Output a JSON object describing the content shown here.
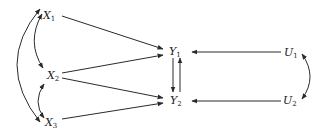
{
  "diagram": {
    "type": "path-diagram",
    "colors": {
      "line": "#2a2a2a",
      "background": "#ffffff"
    },
    "nodes": [
      {
        "id": "X1",
        "letter": "X",
        "sub": "1",
        "x": 43,
        "y": 10
      },
      {
        "id": "X2",
        "letter": "X",
        "sub": "2",
        "x": 47,
        "y": 70
      },
      {
        "id": "X3",
        "letter": "X",
        "sub": "3",
        "x": 45,
        "y": 118
      },
      {
        "id": "Y1",
        "letter": "Y",
        "sub": "1",
        "x": 170,
        "y": 46
      },
      {
        "id": "Y2",
        "letter": "Y",
        "sub": "2",
        "x": 172,
        "y": 95
      },
      {
        "id": "U1",
        "letter": "U",
        "sub": "1",
        "x": 284,
        "y": 47
      },
      {
        "id": "U2",
        "letter": "U",
        "sub": "2",
        "x": 283,
        "y": 95
      }
    ],
    "edges": [
      {
        "from": "X1",
        "to": "Y1",
        "kind": "directed"
      },
      {
        "from": "X2",
        "to": "Y1",
        "kind": "directed"
      },
      {
        "from": "X2",
        "to": "Y2",
        "kind": "directed"
      },
      {
        "from": "X3",
        "to": "Y2",
        "kind": "directed"
      },
      {
        "from": "Y1",
        "to": "Y2",
        "kind": "directed"
      },
      {
        "from": "Y2",
        "to": "Y1",
        "kind": "directed"
      },
      {
        "from": "U1",
        "to": "Y1",
        "kind": "directed"
      },
      {
        "from": "U2",
        "to": "Y2",
        "kind": "directed"
      },
      {
        "from": "X1",
        "to": "X2",
        "kind": "correlation"
      },
      {
        "from": "X2",
        "to": "X3",
        "kind": "correlation"
      },
      {
        "from": "X1",
        "to": "X3",
        "kind": "correlation"
      },
      {
        "from": "U1",
        "to": "U2",
        "kind": "correlation"
      }
    ]
  }
}
